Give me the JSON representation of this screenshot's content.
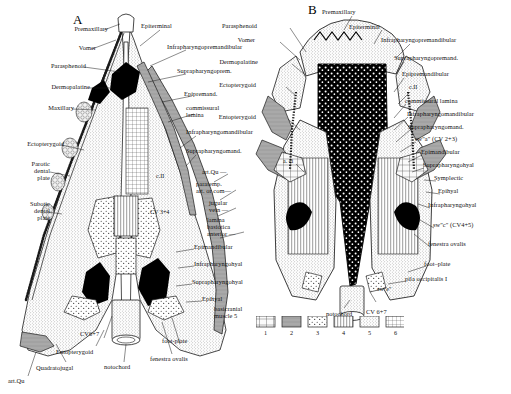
{
  "figure": {
    "panels": [
      {
        "id": "A",
        "letter": "A"
      },
      {
        "id": "B",
        "letter": "B"
      }
    ]
  },
  "panel_a": {
    "letter": "A",
    "labels_left": [
      {
        "text": "Premaxillary",
        "x": 57,
        "y": 28
      },
      {
        "text": "Vomer",
        "x": 63,
        "y": 47
      },
      {
        "text": "Parasphenoid",
        "x": 36,
        "y": 65
      },
      {
        "text": "Dermopalatine",
        "x": 31,
        "y": 85
      },
      {
        "text": "Maxillary",
        "x": 30,
        "y": 106
      },
      {
        "text": "Ectopterygoid",
        "x": 14,
        "y": 142
      },
      {
        "text": "Parotic\ndental\nplate",
        "x": 12,
        "y": 163
      },
      {
        "text": "Subotic\ndental\nplate",
        "x": 11,
        "y": 203
      },
      {
        "text": "art.Qu",
        "x": 12,
        "y": 380
      },
      {
        "text": "Quadratojugal",
        "x": 38,
        "y": 367
      },
      {
        "text": "Entopterygoid",
        "x": 58,
        "y": 350
      },
      {
        "text": "CV6+7",
        "x": 81,
        "y": 333
      },
      {
        "text": "notochord",
        "x": 107,
        "y": 366
      },
      {
        "text": "fenestra ovalis",
        "x": 153,
        "y": 358
      },
      {
        "text": "foot-plate",
        "x": 163,
        "y": 339
      }
    ],
    "labels_center": [
      {
        "text": "Epiterminal",
        "x": 145,
        "y": 24
      },
      {
        "text": "Infrapharyngopremandibular",
        "x": 173,
        "y": 45
      },
      {
        "text": "Suprapharyngoprem.",
        "x": 180,
        "y": 69
      },
      {
        "text": "Epipremand.",
        "x": 186,
        "y": 92
      },
      {
        "text": "commissural\nlamina",
        "x": 188,
        "y": 107
      },
      {
        "text": "Infrapharyngomandibular",
        "x": 190,
        "y": 131
      },
      {
        "text": "Suprapharyngomand.",
        "x": 190,
        "y": 150
      },
      {
        "text": "art.Qu —",
        "x": 205,
        "y": 170
      },
      {
        "text": "paratemp.\nart. or com—",
        "x": 199,
        "y": 182
      },
      {
        "text": "jugular\nvein —",
        "x": 212,
        "y": 201
      },
      {
        "text": "lamina\nbasiotica\nanterior —",
        "x": 210,
        "y": 219
      },
      {
        "text": "Epimandibular",
        "x": 196,
        "y": 245
      },
      {
        "text": "Infrapharyngohyal",
        "x": 196,
        "y": 262
      },
      {
        "text": "Suprapharyngohyal",
        "x": 194,
        "y": 280
      },
      {
        "text": "Epihyal",
        "x": 204,
        "y": 297
      },
      {
        "text": "basicranial\nmuscle 5",
        "x": 217,
        "y": 307
      },
      {
        "text": "c.II",
        "x": 158,
        "y": 175
      },
      {
        "text": "CV 3+4",
        "x": 153,
        "y": 211
      }
    ]
  },
  "panel_b": {
    "letter": "B",
    "labels_left": [
      {
        "text": "Parasphenoid",
        "x": 257,
        "y": 24
      },
      {
        "text": "Vomer",
        "x": 255,
        "y": 38
      },
      {
        "text": "Dermopalatine",
        "x": 257,
        "y": 60
      },
      {
        "text": "Ectopterygoid",
        "x": 255,
        "y": 83
      },
      {
        "text": "Entopterygoid",
        "x": 255,
        "y": 115
      },
      {
        "text": "a. ci",
        "x": 285,
        "y": 160
      },
      {
        "text": "notochord",
        "x": 330,
        "y": 312
      }
    ],
    "labels_right": [
      {
        "text": "Premaxillary",
        "x": 325,
        "y": 10
      },
      {
        "text": "Epiterminal",
        "x": 352,
        "y": 25
      },
      {
        "text": "Infrapharyngopremandibular",
        "x": 385,
        "y": 38
      },
      {
        "text": "Suprapharyngopremand.",
        "x": 398,
        "y": 56
      },
      {
        "text": "Epipremandibular",
        "x": 406,
        "y": 72
      },
      {
        "text": "c.II",
        "x": 412,
        "y": 86
      },
      {
        "text": "commissural lamina",
        "x": 409,
        "y": 99
      },
      {
        "text": "Infrapharyngomandibular",
        "x": 411,
        "y": 112
      },
      {
        "text": "Suprapharyngomand.",
        "x": 412,
        "y": 125
      },
      {
        "text": "sw\"a\" (CV 2+3)",
        "x": 419,
        "y": 137
      },
      {
        "text": "Epimandibular",
        "x": 425,
        "y": 150
      },
      {
        "text": "Suprapharyngohyal",
        "x": 427,
        "y": 163
      },
      {
        "text": "Symplectic",
        "x": 438,
        "y": 176
      },
      {
        "text": "Epihyal",
        "x": 442,
        "y": 189
      },
      {
        "text": "Infrapharyngohyal",
        "x": 432,
        "y": 203
      },
      {
        "text": "sw\"c\" (CV4+5)",
        "x": 437,
        "y": 223
      },
      {
        "text": "fenestra ovalis",
        "x": 432,
        "y": 242
      },
      {
        "text": "foot–plate",
        "x": 428,
        "y": 262
      },
      {
        "text": "pila occipitalis I",
        "x": 409,
        "y": 277
      },
      {
        "text": "sw\"e\"",
        "x": 380,
        "y": 288
      },
      {
        "text": "CV 6+7",
        "x": 370,
        "y": 310
      }
    ]
  },
  "legend": {
    "items": [
      {
        "number": "1",
        "pattern": "cellular-light"
      },
      {
        "number": "2",
        "pattern": "solid-gray"
      },
      {
        "number": "3",
        "pattern": "coarse-stipple"
      },
      {
        "number": "4",
        "pattern": "vertical-lines"
      },
      {
        "number": "5",
        "pattern": "fine-stipple"
      },
      {
        "number": "6",
        "pattern": "cross-hatch"
      }
    ]
  },
  "colors": {
    "ink": "#1a1a1a",
    "paper": "#ffffff",
    "gray_fill": "#a9a9a9",
    "light_fill": "#e4e4e4",
    "black_fill": "#000000"
  }
}
